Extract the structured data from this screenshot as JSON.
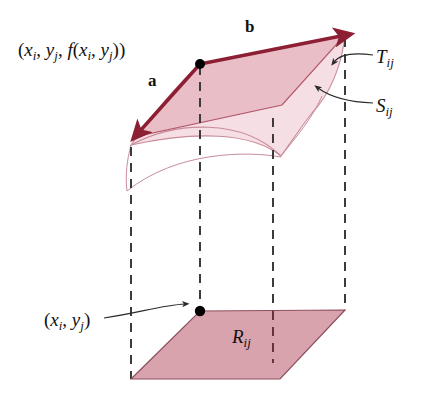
{
  "figure": {
    "background_color": "#ffffff",
    "width": 423,
    "height": 419
  },
  "colors": {
    "arrow_maroon": "#8c1f33",
    "tangent_plane_fill": "#e7b9c2",
    "tangent_plane_edge": "#b2576b",
    "surface_fill": "#f6dfe4",
    "surface_edge": "#c98b9a",
    "base_rect_fill": "#d9a3ae",
    "base_rect_edge": "#8e4f5d",
    "dashed_line": "#3b3b3b",
    "leader_line": "#2b2b2b",
    "text": "#111111",
    "dot": "#000000"
  },
  "labels": {
    "point_3d": {
      "name": "point-xi-yj-f",
      "open": "(",
      "x_var": "x",
      "x_sub": "i",
      "comma1": ", ",
      "y_var": "y",
      "y_sub": "j",
      "comma2": ",  ",
      "f_var": "f",
      "inner_open": "(",
      "fx_var": "x",
      "fx_sub": "i",
      "comma3": ", ",
      "fy_var": "y",
      "fy_sub": "j",
      "inner_close": ")",
      "close": ")",
      "plain": "(xi, yj, f(xi, yj))"
    },
    "point_2d": {
      "name": "point-xi-yj",
      "open": "(",
      "x_var": "x",
      "x_sub": "i",
      "comma1": ", ",
      "y_var": "y",
      "y_sub": "j",
      "close": ")",
      "plain": "(xi, yj)"
    },
    "tangent_plane": {
      "name": "tangent-plane-label",
      "symbol": "T",
      "subscript": "ij",
      "plain": "Tij"
    },
    "surface_patch": {
      "name": "surface-patch-label",
      "symbol": "S",
      "subscript": "ij",
      "plain": "Sij"
    },
    "base_rect": {
      "name": "base-rectangle-label",
      "symbol": "R",
      "subscript": "ij",
      "plain": "Rij"
    },
    "vector_a": {
      "name": "vector-a-label",
      "symbol": "a"
    },
    "vector_b": {
      "name": "vector-b-label",
      "symbol": "b"
    }
  },
  "geometry": {
    "tangent_plane_polygon": "200,64 345,35 282,105 134,137",
    "surface_patch_path": "M 200,64 L 345,35 C 341,62 330,92 312,112 C 300,126 292,140 281,156 C 252,133 196,131 131,145 C 150,118 172,90 200,64 Z",
    "surface_front_curve": "M 131,145 C 175,120 240,116 281,156",
    "surface_left_curve": "M 131,145 C 128,160 126,175 127,190",
    "surface_lower_curve": "M 127,190 C 176,150 246,150 281,156",
    "base_rect_polygon": "200,311 345,310 280,379 131,379",
    "vector_a": {
      "from": "200,64",
      "to": "137,135"
    },
    "vector_b": {
      "from": "200,64",
      "to": "345,35"
    },
    "dashed_verticals": [
      {
        "name": "dash-left",
        "x": 131,
        "y1": 147,
        "y2": 379
      },
      {
        "name": "dash-mid-left",
        "x": 200,
        "y1": 66,
        "y2": 311
      },
      {
        "name": "dash-mid-right",
        "x": 273,
        "y1": 118,
        "y2": 360
      },
      {
        "name": "dash-right",
        "x": 345,
        "y1": 38,
        "y2": 310
      }
    ],
    "dots": [
      {
        "name": "tangency-point-dot",
        "cx": 200,
        "cy": 64,
        "r": 5
      },
      {
        "name": "base-point-dot",
        "cx": 200,
        "cy": 311,
        "r": 5
      }
    ],
    "leaders": [
      {
        "name": "leader-to-tangent-plane",
        "path": "M 371,55 C 350,52 338,55 332,62",
        "arrow_at": "330,64"
      },
      {
        "name": "leader-to-surface",
        "path": "M 371,103 C 345,102 328,96 316,88",
        "arrow_at": "313,86"
      },
      {
        "name": "leader-to-base-point",
        "path": "M 106,317 C 140,312 165,305 187,305",
        "arrow_at": "191,306"
      }
    ]
  }
}
